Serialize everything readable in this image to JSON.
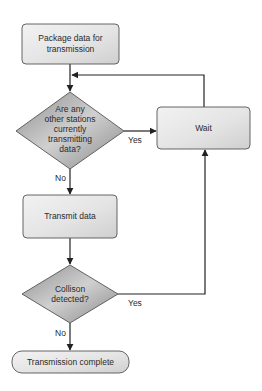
{
  "diagram": {
    "type": "flowchart",
    "colors": {
      "process_fill_light": "#f0f0f0",
      "process_fill_dark": "#d4d4d4",
      "decision_fill_light": "#c8c8c8",
      "decision_fill_dark": "#8e8e8e",
      "stroke": "#555555",
      "edge": "#222222"
    },
    "nodes": {
      "package": {
        "shape": "process",
        "lines": [
          "Package data for",
          "transmission"
        ]
      },
      "check_stations": {
        "shape": "decision",
        "lines": [
          "Are any",
          "other stations",
          "currently",
          "transmitting",
          "data?"
        ]
      },
      "wait": {
        "shape": "process",
        "lines": [
          "Wait"
        ]
      },
      "transmit": {
        "shape": "process",
        "lines": [
          "Transmit data"
        ]
      },
      "collision": {
        "shape": "decision",
        "lines": [
          "Collison",
          "detected?"
        ]
      },
      "complete": {
        "shape": "terminal",
        "lines": [
          "Transmission complete"
        ]
      }
    },
    "edges": {
      "package_to_check": {
        "from": "package",
        "to": "check_stations",
        "label": ""
      },
      "check_yes": {
        "from": "check_stations",
        "to": "wait",
        "label": "Yes"
      },
      "check_no": {
        "from": "check_stations",
        "to": "transmit",
        "label": "No"
      },
      "wait_loop": {
        "from": "wait",
        "to": "check_stations",
        "label": ""
      },
      "transmit_to_collision": {
        "from": "transmit",
        "to": "collision",
        "label": ""
      },
      "collision_yes": {
        "from": "collision",
        "to": "wait",
        "label": "Yes"
      },
      "collision_no": {
        "from": "collision",
        "to": "complete",
        "label": "No"
      }
    }
  }
}
